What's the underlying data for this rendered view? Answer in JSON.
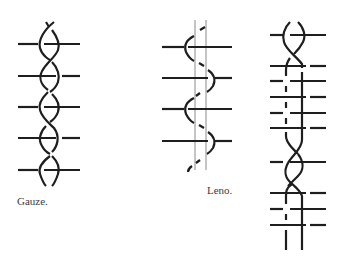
{
  "figures": [
    {
      "id": "gauze",
      "caption": "Gauze."
    },
    {
      "id": "leno",
      "caption": "Leno."
    },
    {
      "id": "leno-combined",
      "caption": ""
    }
  ],
  "colors": {
    "ink": "#1e1e1e",
    "guide": "#8a8a8a",
    "background": "#ffffff"
  }
}
